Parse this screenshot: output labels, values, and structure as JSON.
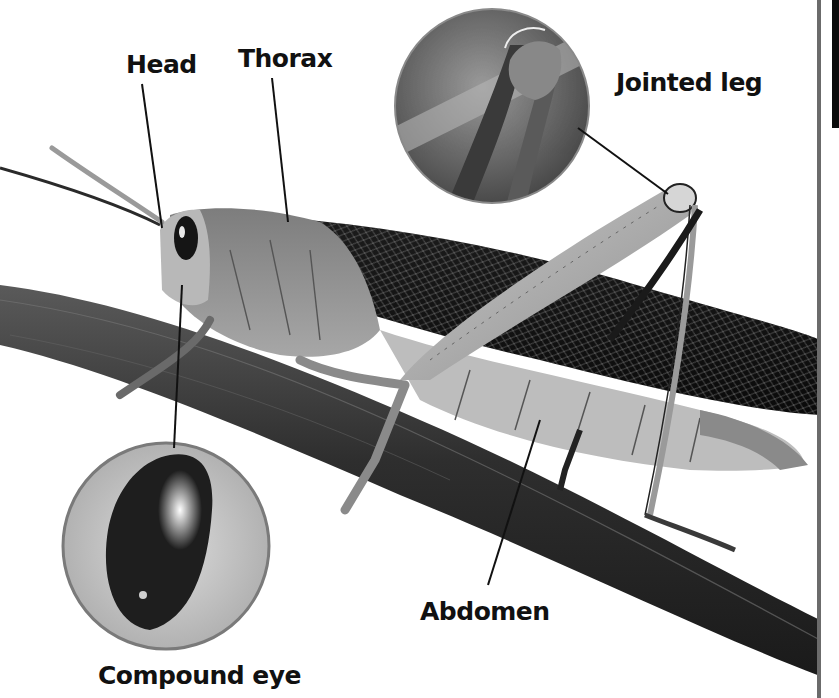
{
  "diagram": {
    "labels": {
      "head": "Head",
      "thorax": "Thorax",
      "jointed_leg": "Jointed leg",
      "abdomen": "Abdomen",
      "compound_eye": "Compound eye"
    },
    "insets": [
      {
        "name": "jointed-leg-closeup",
        "depicts": "Close-up of leg joint"
      },
      {
        "name": "compound-eye-closeup",
        "depicts": "Close-up of compound eye"
      }
    ],
    "colors": {
      "background": "#ffffff",
      "label_text": "#111111",
      "leader_line": "#111111",
      "inset_border": "#8a8a8a"
    }
  }
}
